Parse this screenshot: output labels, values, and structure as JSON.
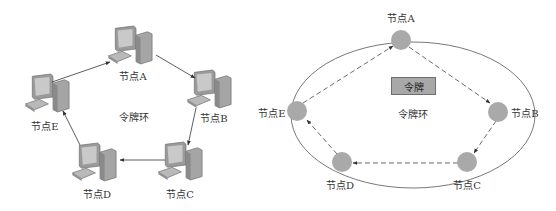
{
  "left_diagram": {
    "center_label": "令牌环",
    "nodes": [
      {
        "id": "A",
        "label": "节点A"
      },
      {
        "id": "B",
        "label": "节点B"
      },
      {
        "id": "C",
        "label": "节点C"
      },
      {
        "id": "D",
        "label": "节点D"
      },
      {
        "id": "E",
        "label": "节点E"
      }
    ],
    "edges": [
      "A→B",
      "B→C",
      "C→D",
      "D→E",
      "E→A"
    ],
    "node_icon": "desktop-computer-icon"
  },
  "right_diagram": {
    "token_label": "令牌",
    "center_label": "令牌环",
    "nodes": [
      {
        "id": "A",
        "label": "节点A"
      },
      {
        "id": "B",
        "label": "节点B"
      },
      {
        "id": "C",
        "label": "节点C"
      },
      {
        "id": "D",
        "label": "节点D"
      },
      {
        "id": "E",
        "label": "节点E"
      }
    ],
    "token_path": [
      "A→B",
      "B→C",
      "C→D",
      "D→E",
      "E→A"
    ],
    "colors": {
      "node_fill": "#a9a9a9",
      "token_fill": "#a8a8a8",
      "line": "#555555"
    }
  }
}
